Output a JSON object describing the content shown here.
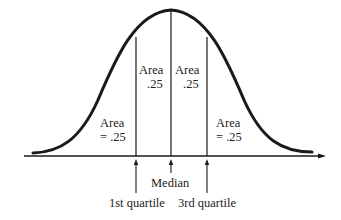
{
  "diagram": {
    "type": "normal-distribution-quartiles",
    "colors": {
      "stroke": "#1a1a1a",
      "text": "#222222",
      "background": "#ffffff"
    },
    "regions": [
      {
        "line1": "Area",
        "line2": "= .25"
      },
      {
        "line1": "Area",
        "line2": ".25"
      },
      {
        "line1": "Area",
        "line2": ".25"
      },
      {
        "line1": "Area",
        "line2": "= .25"
      }
    ],
    "markers": {
      "q1": "1st quartile",
      "median": "Median",
      "q3": "3rd quartile"
    }
  }
}
